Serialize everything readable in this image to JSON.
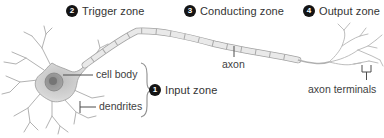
{
  "zones": [
    {
      "number": "1",
      "label": "Input zone"
    },
    {
      "number": "2",
      "label": "Trigger zone"
    },
    {
      "number": "3",
      "label": "Conducting zone"
    },
    {
      "number": "4",
      "label": "Output zone"
    }
  ],
  "parts": {
    "cell_body": "cell body",
    "dendrites": "dendrites",
    "axon": "axon",
    "axon_terminals": "axon terminals"
  },
  "colors": {
    "background": "#ffffff",
    "badge_bg": "#141414",
    "badge_text": "#ffffff",
    "zone_text": "#333333",
    "part_text": "#414141",
    "pointer_line": "#4d4d4d",
    "neuron_outline": "#9a9a9a",
    "neuron_fill_light": "#e9e9e9",
    "neuron_fill_mid": "#c6c6c6",
    "nucleus_fill": "#9c9c9c",
    "dendrite_line": "#b2b2b2"
  }
}
